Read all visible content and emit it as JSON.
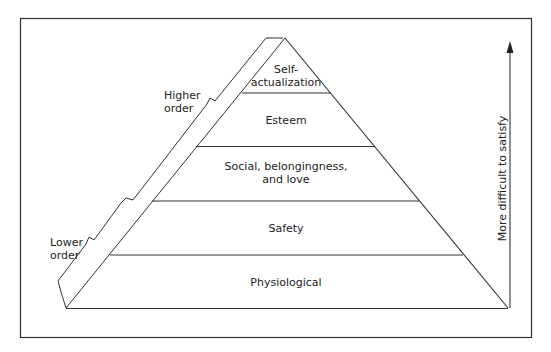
{
  "diagram": {
    "levels": [
      {
        "label": "Self-\nactualization"
      },
      {
        "label": "Esteem"
      },
      {
        "label": "Social, belongingness,\nand love"
      },
      {
        "label": "Safety"
      },
      {
        "label": "Physiological"
      }
    ],
    "brackets": {
      "higher": "Higher\norder",
      "lower": "Lower\norder"
    },
    "axis_label": "More difficult to satisfy",
    "colors": {
      "line": "#333333",
      "background": "#ffffff"
    }
  }
}
